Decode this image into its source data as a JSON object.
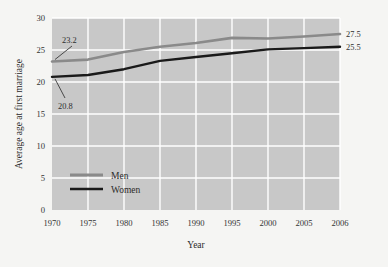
{
  "chart_data": {
    "type": "line",
    "title": "",
    "xlabel": "Year",
    "ylabel": "Average age at first marriage",
    "categories": [
      "1970",
      "1975",
      "1980",
      "1985",
      "1990",
      "1995",
      "2000",
      "2005",
      "2006"
    ],
    "xlim": [
      0,
      8
    ],
    "ylim": [
      0,
      30
    ],
    "yticks": [
      "0",
      "5",
      "10",
      "15",
      "20",
      "25",
      "30"
    ],
    "ytick_values": [
      0,
      5,
      10,
      15,
      20,
      25,
      30
    ],
    "grid": true,
    "legend_position": "inside-lower-left",
    "series": [
      {
        "name": "Men",
        "color": "#8a8a8a",
        "values": [
          23.2,
          23.5,
          24.7,
          25.5,
          26.1,
          26.9,
          26.8,
          27.1,
          27.5
        ],
        "start_label": "23.2",
        "end_label": "27.5"
      },
      {
        "name": "Women",
        "color": "#1a1a1a",
        "values": [
          20.8,
          21.1,
          22.0,
          23.3,
          23.9,
          24.5,
          25.1,
          25.3,
          25.5
        ],
        "start_label": "20.8",
        "end_label": "25.5"
      }
    ],
    "annotations": [
      {
        "text": "23.2",
        "series": "Men",
        "position": "start-upper-left"
      },
      {
        "text": "20.8",
        "series": "Women",
        "position": "start-lower-left"
      },
      {
        "text": "27.5",
        "series": "Men",
        "position": "end-right"
      },
      {
        "text": "25.5",
        "series": "Women",
        "position": "end-right"
      }
    ],
    "colors": {
      "plot_background": "#c8c8c8",
      "gridline": "#ffffff",
      "figure_background": "#f5f5f3",
      "men_line": "#8a8a8a",
      "women_line": "#1a1a1a",
      "text": "#2b2b2b"
    }
  },
  "legend": {
    "items": [
      {
        "label": "Men",
        "color": "#8a8a8a"
      },
      {
        "label": "Women",
        "color": "#1a1a1a"
      }
    ]
  }
}
